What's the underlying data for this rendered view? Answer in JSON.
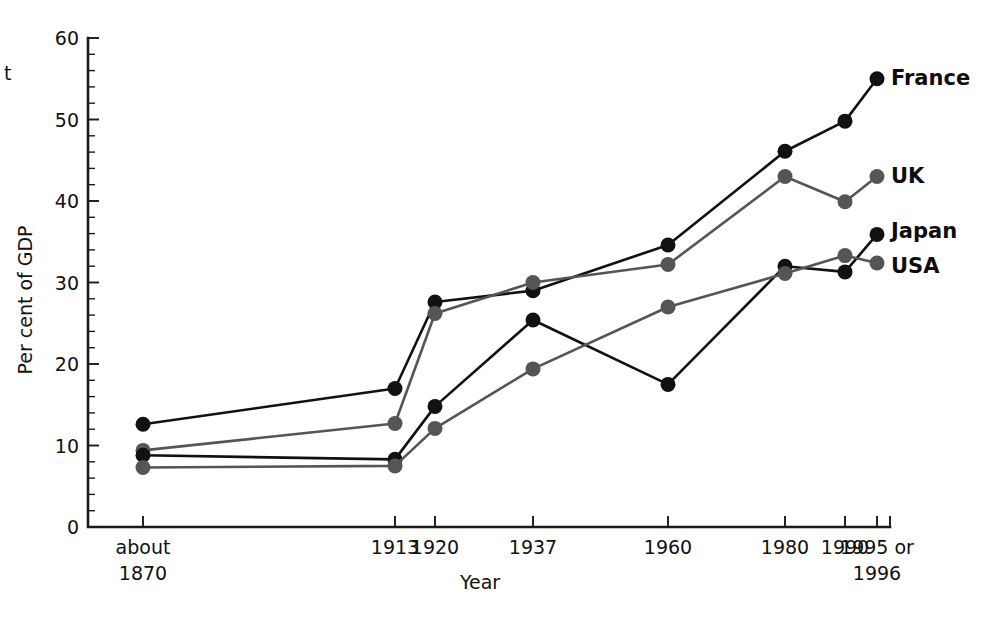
{
  "figure": {
    "stray_margin_text": "t",
    "axis_titles": {
      "y": "Per cent of GDP",
      "x": "Year"
    }
  },
  "chart_data": {
    "type": "line",
    "title": "",
    "xlabel": "Year",
    "ylabel": "Per cent of GDP",
    "ylim": [
      0,
      60
    ],
    "grid": false,
    "legend_position": "right-inline-labels",
    "y_ticks": [
      0,
      10,
      20,
      30,
      40,
      50,
      60
    ],
    "y_tick_labels": [
      "0",
      "10",
      "20",
      "30",
      "40",
      "50",
      "60"
    ],
    "y_minor_tick_step": 2,
    "categories": [
      "about 1870",
      "1913",
      "1920",
      "1937",
      "1960",
      "1980",
      "1990",
      "1995 or 1996"
    ],
    "x_tick_labels": [
      "about",
      "1913",
      "1920",
      "1937",
      "1960",
      "1980",
      "1990",
      "1995 or"
    ],
    "x_tick_labels_line2": [
      "1870",
      "",
      "",
      "",
      "",
      "",
      "",
      "1996"
    ],
    "series": [
      {
        "name": "France",
        "color": "#111111",
        "values": [
          12.6,
          17.0,
          27.6,
          29.0,
          34.6,
          46.1,
          49.8,
          55.0
        ]
      },
      {
        "name": "UK",
        "color": "#555555",
        "values": [
          9.4,
          12.7,
          26.2,
          30.0,
          32.2,
          43.0,
          39.9,
          43.0
        ]
      },
      {
        "name": "Japan",
        "color": "#111111",
        "values": [
          8.8,
          8.3,
          14.8,
          25.4,
          17.5,
          32.0,
          31.3,
          35.9
        ]
      },
      {
        "name": "USA",
        "color": "#555555",
        "values": [
          7.3,
          7.5,
          12.1,
          19.4,
          27.0,
          31.1,
          33.3,
          32.4
        ]
      }
    ],
    "annotations": [
      {
        "text": "France",
        "series": "France"
      },
      {
        "text": "UK",
        "series": "UK"
      },
      {
        "text": "Japan",
        "series": "Japan"
      },
      {
        "text": "USA",
        "series": "USA"
      }
    ]
  }
}
